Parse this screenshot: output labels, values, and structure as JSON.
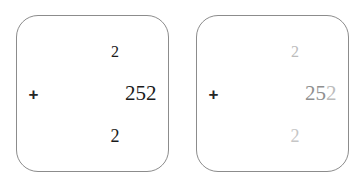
{
  "canvas": {
    "width": 363,
    "height": 188,
    "background_color": "#ffffff"
  },
  "colors": {
    "card_border": "#8c8c8c",
    "card_fill": "#ffffff",
    "ink_dark": "#1a1a1a",
    "ink_mid": "#8f8f8f",
    "ink_light": "#bcbcbc",
    "ink_faint": "#c6c6c6"
  },
  "cards": [
    {
      "id": "left",
      "operator": "+",
      "carry_row": "2",
      "main_row_parts": [
        "2",
        "5",
        "2"
      ],
      "answer_row": "2",
      "carry_tone": "ink-dark",
      "main_tones": [
        "ink-dark",
        "ink-dark",
        "ink-dark"
      ],
      "answer_tone": "ink-dark"
    },
    {
      "id": "right",
      "operator": "+",
      "carry_row": "2",
      "main_row_parts": [
        "2",
        "5",
        "2"
      ],
      "answer_row": "2",
      "carry_tone": "ink-light",
      "main_tones": [
        "ink-mid",
        "ink-mid",
        "ink-light"
      ],
      "answer_tone": "ink-faint"
    }
  ]
}
